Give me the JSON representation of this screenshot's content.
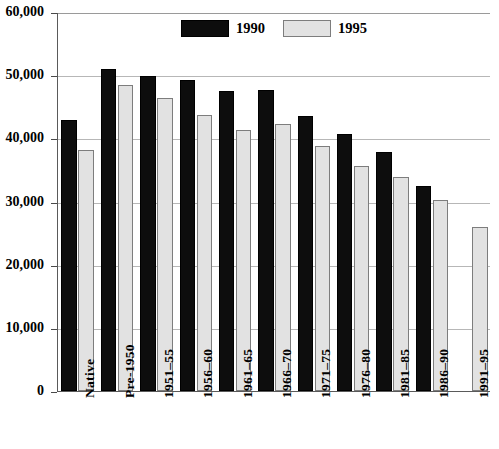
{
  "chart_data": {
    "type": "bar",
    "title": "",
    "subtitle": "",
    "xlabel": "",
    "ylabel": "",
    "ylim": [
      0,
      60000
    ],
    "ytick_step": 10000,
    "grid": true,
    "legend_position": "top-center",
    "categories": [
      "Native",
      "Pre-1950",
      "1951–55",
      "1956–60",
      "1961–65",
      "1966–70",
      "1971–75",
      "1976–80",
      "1981–85",
      "1986–90",
      "1991–95"
    ],
    "ytick_labels": [
      "60,000",
      "50,000",
      "40,000",
      "30,000",
      "20,000",
      "10,000",
      "0"
    ],
    "ytick_values": [
      60000,
      50000,
      40000,
      30000,
      20000,
      10000,
      0
    ],
    "series": [
      {
        "name": "1990",
        "color": "#0d0d0d",
        "values": [
          42900,
          50900,
          49900,
          49300,
          47500,
          47600,
          43500,
          40700,
          37900,
          32400,
          null
        ]
      },
      {
        "name": "1995",
        "color": "#e2e2e2",
        "values": [
          38100,
          48400,
          46400,
          43700,
          41300,
          42300,
          38800,
          35700,
          33900,
          30200,
          26000
        ]
      }
    ]
  },
  "legend": {
    "items": [
      {
        "label": "1990",
        "swatch": "black-filled-swatch"
      },
      {
        "label": "1995",
        "swatch": "light-gray-swatch"
      }
    ]
  },
  "colors": {
    "series_1990": "#0d0d0d",
    "series_1995": "#e2e2e2",
    "series_1995_border": "#7d7d7d",
    "gridline": "#b7b7b7",
    "axis": "#5a5a5a",
    "background": "#ffffff",
    "text": "#000000"
  }
}
